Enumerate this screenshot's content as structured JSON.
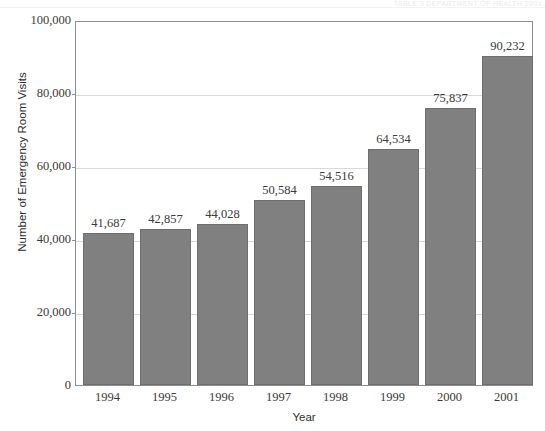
{
  "page": {
    "cut_off_header": "TABLE 3 DEPARTMENT OF HEALTH 2001",
    "bar_color": "#808080",
    "bar_border_color": "#6e6e6e",
    "frame_color": "#8e8e8e",
    "gridline_color": "#d9d9dd",
    "text_color": "#3a3a3a"
  },
  "chart_data": {
    "type": "bar",
    "title": "",
    "subtitle": "",
    "xlabel": "Year",
    "ylabel": "Number of Emergency Room Visits",
    "categories": [
      "1994",
      "1995",
      "1996",
      "1997",
      "1998",
      "1999",
      "2000",
      "2001"
    ],
    "values": [
      41687,
      42857,
      44028,
      50584,
      54516,
      64534,
      75837,
      90232
    ],
    "value_labels": [
      "41,687",
      "42,857",
      "44,028",
      "50,584",
      "54,516",
      "64,534",
      "75,837",
      "90,232"
    ],
    "ylim": [
      0,
      100000
    ],
    "ytick_values": [
      0,
      20000,
      40000,
      60000,
      80000,
      100000
    ],
    "ytick_labels": [
      "0",
      "20,000",
      "40,000",
      "60,000",
      "80,000",
      "100,000"
    ],
    "grid": true,
    "grid_axis": "y",
    "legend": false,
    "legend_position": "none",
    "series": [
      {
        "name": "Emergency Room Visits",
        "values": [
          41687,
          42857,
          44028,
          50584,
          54516,
          64534,
          75837,
          90232
        ]
      }
    ]
  }
}
